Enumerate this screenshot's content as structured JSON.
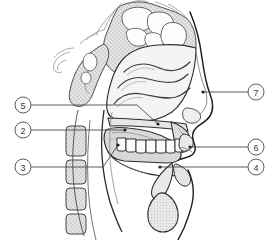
{
  "figure": {
    "width": 274,
    "height": 240,
    "background_color": "#ffffff"
  },
  "style": {
    "outline_color": "#1a1a1a",
    "detail_line_color": "#555555",
    "leader_line_color": "#4a4a4a",
    "callout_circle_fill": "#ffffff",
    "callout_circle_stroke": "#555555",
    "callout_text_color": "#3a3a3a",
    "bone_fill": "#e2e2e2",
    "cavity_fill": "#f2f2f2",
    "soft_tissue_fill": "#dcdcdc",
    "tongue_fill": "#d8d8d8",
    "tooth_fill": "#fbfbfb",
    "stipple_color": "#9a9a9a"
  },
  "callouts": [
    {
      "id": "callout-5",
      "label": "5",
      "side": "left",
      "circle_cx": 23,
      "circle_cy": 105,
      "circle_r": 8,
      "leader_points": "31,105 137,105 158,124",
      "target_dot": {
        "cx": 158,
        "cy": 124,
        "r": 1.6
      }
    },
    {
      "id": "callout-2",
      "label": "2",
      "side": "left",
      "circle_cx": 23,
      "circle_cy": 130,
      "circle_r": 8,
      "leader_points": "31,130 125,130",
      "target_dot": {
        "cx": 125,
        "cy": 130,
        "r": 1.6
      }
    },
    {
      "id": "callout-3",
      "label": "3",
      "side": "left",
      "circle_cx": 23,
      "circle_cy": 167,
      "circle_r": 8,
      "leader_points": "31,167 103,167 118,145",
      "target_dot": {
        "cx": 118,
        "cy": 145,
        "r": 1.6
      }
    },
    {
      "id": "callout-7",
      "label": "7",
      "side": "right",
      "circle_cx": 256,
      "circle_cy": 92,
      "circle_r": 8,
      "leader_points": "248,92 203,92",
      "target_dot": {
        "cx": 203,
        "cy": 92,
        "r": 1.6
      }
    },
    {
      "id": "callout-6",
      "label": "6",
      "side": "right",
      "circle_cx": 256,
      "circle_cy": 147,
      "circle_r": 8,
      "leader_points": "248,147 190,147",
      "target_dot": {
        "cx": 190,
        "cy": 147,
        "r": 1.6
      }
    },
    {
      "id": "callout-4",
      "label": "4",
      "side": "right",
      "circle_cx": 256,
      "circle_cy": 167,
      "circle_r": 8,
      "leader_points": "248,167 160,167",
      "target_dot": {
        "cx": 160,
        "cy": 167,
        "r": 1.6
      }
    }
  ],
  "structures": [
    {
      "id": "cranial-base",
      "name": "cranial-base-bone"
    },
    {
      "id": "frontal-sinus",
      "name": "frontal-sinus"
    },
    {
      "id": "sphenoid-sinus",
      "name": "sphenoid-sinus"
    },
    {
      "id": "nasal-cavity",
      "name": "nasal-cavity"
    },
    {
      "id": "superior-concha",
      "name": "superior-nasal-concha"
    },
    {
      "id": "middle-concha",
      "name": "middle-nasal-concha"
    },
    {
      "id": "inferior-concha",
      "name": "inferior-nasal-concha"
    },
    {
      "id": "nose-profile",
      "name": "external-nose-profile"
    },
    {
      "id": "hard-palate",
      "name": "hard-palate"
    },
    {
      "id": "soft-palate",
      "name": "soft-palate"
    },
    {
      "id": "tongue",
      "name": "tongue"
    },
    {
      "id": "teeth-upper",
      "name": "upper-teeth-row"
    },
    {
      "id": "lips",
      "name": "lips"
    },
    {
      "id": "mandible",
      "name": "mandible"
    },
    {
      "id": "pharynx",
      "name": "pharynx"
    },
    {
      "id": "epiglottis",
      "name": "epiglottis"
    },
    {
      "id": "larynx",
      "name": "larynx"
    },
    {
      "id": "hyoid",
      "name": "hyoid-bone"
    },
    {
      "id": "trachea",
      "name": "trachea"
    },
    {
      "id": "vertebrae",
      "name": "cervical-vertebrae"
    },
    {
      "id": "spinal-canal",
      "name": "spinal-canal"
    }
  ],
  "teeth": [
    {
      "x": 117,
      "y": 138,
      "w": 9,
      "h": 13
    },
    {
      "x": 126,
      "y": 139,
      "w": 10,
      "h": 13
    },
    {
      "x": 136,
      "y": 140,
      "w": 10,
      "h": 13
    },
    {
      "x": 146,
      "y": 140,
      "w": 10,
      "h": 13
    },
    {
      "x": 156,
      "y": 140,
      "w": 10,
      "h": 13
    },
    {
      "x": 166,
      "y": 140,
      "w": 9,
      "h": 13
    },
    {
      "x": 175,
      "y": 139,
      "w": 8,
      "h": 13
    }
  ],
  "vertebrae": [
    {
      "x": 66,
      "y": 126,
      "w": 20,
      "h": 30
    },
    {
      "x": 66,
      "y": 160,
      "w": 20,
      "h": 24
    },
    {
      "x": 66,
      "y": 188,
      "w": 20,
      "h": 22
    },
    {
      "x": 66,
      "y": 214,
      "w": 20,
      "h": 20
    }
  ]
}
